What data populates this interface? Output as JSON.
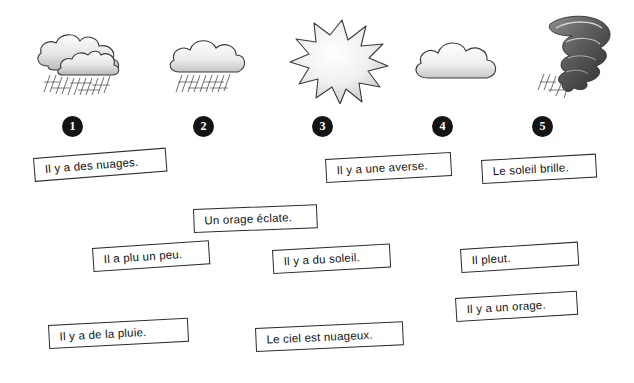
{
  "worksheet": {
    "title": "Les expressions de la météo",
    "icons": [
      {
        "id": 1,
        "name": "rain-clouds-icon",
        "label": "nuages avec pluie"
      },
      {
        "id": 2,
        "name": "light-rain-cloud-icon",
        "label": "nuage avec pluie légère"
      },
      {
        "id": 3,
        "name": "sun-icon",
        "label": "soleil"
      },
      {
        "id": 4,
        "name": "cloud-icon",
        "label": "nuage"
      },
      {
        "id": 5,
        "name": "storm-tornado-icon",
        "label": "orage tornade"
      }
    ],
    "numbers": [
      "1",
      "2",
      "3",
      "4",
      "5"
    ],
    "sentences": [
      {
        "text": "Il y a des nuages."
      },
      {
        "text": "Il y a une averse."
      },
      {
        "text": "Le soleil brille."
      },
      {
        "text": "Un orage éclate."
      },
      {
        "text": "Il a plu un peu."
      },
      {
        "text": "Il y a du soleil."
      },
      {
        "text": "Il pleut."
      },
      {
        "text": "Il y a de la pluie."
      },
      {
        "text": "Le ciel est nuageux."
      },
      {
        "text": "Il y a un orage."
      }
    ]
  }
}
